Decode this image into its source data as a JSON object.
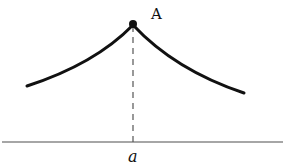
{
  "diagram": {
    "point_label": "A",
    "axis_label": "a",
    "colors": {
      "curve": "#111111",
      "axis": "#888888",
      "dash": "#555555"
    }
  }
}
